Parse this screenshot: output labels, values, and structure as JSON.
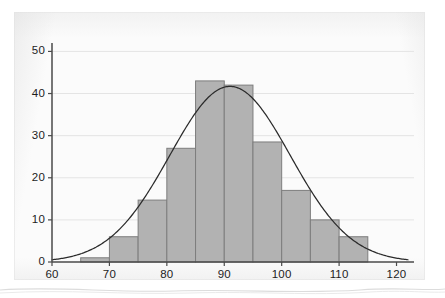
{
  "figure": {
    "kind": "histogram-with-normal-curve",
    "background_color": "#fbfbfb",
    "panel_border_color": "#ececec"
  },
  "colors": {
    "bar_fill": "#b2b2b2",
    "bar_stroke": "#7d7d7d",
    "curve": "#2b2b2b",
    "axis": "#4a4a4a",
    "gridline": "#e4e4e4",
    "tick_text": "#1d1d1d"
  },
  "axes": {
    "x": {
      "min": 60,
      "max": 122,
      "tick_labels": [
        "60",
        "70",
        "80",
        "90",
        "100",
        "110",
        "120"
      ],
      "tick_values": [
        60,
        70,
        80,
        90,
        100,
        110,
        120
      ],
      "label": ""
    },
    "y": {
      "min": 0,
      "max": 52,
      "tick_labels": [
        "0",
        "10",
        "20",
        "30",
        "40",
        "50"
      ],
      "tick_values": [
        0,
        10,
        20,
        30,
        40,
        50
      ],
      "label": ""
    },
    "gridlines": "horizontal"
  },
  "chart_data": {
    "type": "bar",
    "title": "",
    "subtitle": "",
    "xlabel": "",
    "ylabel": "",
    "xlim": [
      60,
      122
    ],
    "ylim": [
      0,
      52
    ],
    "grid": true,
    "legend": "none",
    "bin_width": 5,
    "bin_edges": [
      60,
      65,
      70,
      75,
      80,
      85,
      90,
      95,
      100,
      105,
      110,
      115,
      120
    ],
    "categories": [
      "60-65",
      "65-70",
      "70-75",
      "75-80",
      "80-85",
      "85-90",
      "90-95",
      "95-100",
      "100-105",
      "105-110",
      "110-115",
      "115-120"
    ],
    "bin_centers": [
      62.5,
      67.5,
      72.5,
      77.5,
      82.5,
      87.5,
      92.5,
      97.5,
      102.5,
      107.5,
      112.5,
      117.5
    ],
    "values": [
      0,
      1,
      6,
      14.7,
      27,
      43,
      42,
      28.5,
      17,
      10,
      6,
      0
    ],
    "series": [
      {
        "name": "Frequency",
        "values": [
          0,
          1,
          6,
          14.7,
          27,
          43,
          42,
          28.5,
          17,
          10,
          6,
          0
        ]
      }
    ],
    "overlay": {
      "type": "line",
      "name": "Normal curve",
      "mean": 91,
      "sigma": 10.5,
      "peak_value": 41.7,
      "peak_x": 91,
      "x_start": 60,
      "x_end": 122
    },
    "annotations": []
  },
  "ticks": {
    "y": [
      {
        "label": "50",
        "value": 50
      },
      {
        "label": "40",
        "value": 40
      },
      {
        "label": "30",
        "value": 30
      },
      {
        "label": "20",
        "value": 20
      },
      {
        "label": "10",
        "value": 10
      },
      {
        "label": "0",
        "value": 0
      }
    ],
    "x": [
      {
        "label": "60",
        "value": 60
      },
      {
        "label": "70",
        "value": 70
      },
      {
        "label": "80",
        "value": 80
      },
      {
        "label": "90",
        "value": 90
      },
      {
        "label": "100",
        "value": 100
      },
      {
        "label": "110",
        "value": 110
      },
      {
        "label": "120",
        "value": 120
      }
    ]
  }
}
